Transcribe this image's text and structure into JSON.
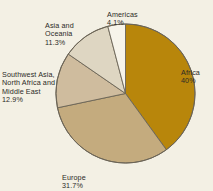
{
  "chart_data": {
    "type": "pie",
    "title": "",
    "subtitle": "",
    "xlabel": "",
    "ylabel": "",
    "legend_position": "none",
    "grid": false,
    "labels_outside": true,
    "start_angle_deg": 0,
    "direction": "clockwise",
    "categories": [
      "Africa",
      "Europe",
      "Southwest Asia,\nNorth Africa and\nMiddle East",
      "Asia and\nOceania",
      "Americas"
    ],
    "values": [
      40,
      31.7,
      12.9,
      11.3,
      4.1
    ],
    "value_labels": [
      "40%",
      "31.7%",
      "12.9%",
      "11.3%",
      "4.1%"
    ],
    "colors": [
      "#b8860b",
      "#c4ab7e",
      "#cfbc9e",
      "#ded6c2",
      "#f7f4ea"
    ],
    "slices": [
      {
        "name": "Africa",
        "label": "Africa",
        "value": 40,
        "value_label": "40%",
        "color": "#b8860b",
        "start_deg": 0,
        "end_deg": 144
      },
      {
        "name": "Europe",
        "label": "Europe",
        "value": 31.7,
        "value_label": "31.7%",
        "color": "#c4ab7e",
        "start_deg": 144,
        "end_deg": 258.12
      },
      {
        "name": "Southwest Asia, North Africa and Middle East",
        "label": "Southwest Asia,\nNorth Africa and\nMiddle East",
        "value": 12.9,
        "value_label": "12.9%",
        "color": "#cfbc9e",
        "start_deg": 258.12,
        "end_deg": 304.56
      },
      {
        "name": "Asia and Oceania",
        "label": "Asia and\nOceania",
        "value": 11.3,
        "value_label": "11.3%",
        "color": "#ded6c2",
        "start_deg": 304.56,
        "end_deg": 345.24
      },
      {
        "name": "Americas",
        "label": "Americas",
        "value": 4.1,
        "value_label": "4.1%",
        "color": "#f7f4ea",
        "start_deg": 345.24,
        "end_deg": 360
      }
    ],
    "total": 100,
    "units": "percent"
  },
  "style": {
    "background": "#f3f0e4",
    "outline": "#6b6456",
    "text": "#2b2a26"
  },
  "labels": {
    "africa": {
      "name": "Africa",
      "pct": "40%"
    },
    "europe": {
      "name": "Europe",
      "pct": "31.7%"
    },
    "swasia": {
      "name": "Southwest Asia,\nNorth Africa and\nMiddle East",
      "pct": "12.9%"
    },
    "asia_oceania": {
      "name": "Asia and\nOceania",
      "pct": "11.3%"
    },
    "americas": {
      "name": "Americas",
      "pct": "4.1%"
    }
  }
}
